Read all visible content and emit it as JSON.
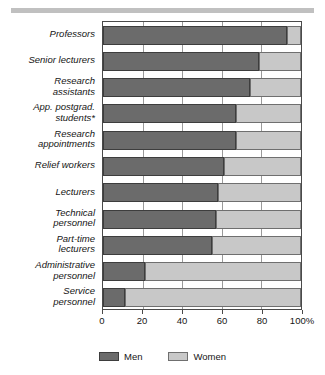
{
  "chart_data": {
    "type": "bar",
    "orientation": "horizontal",
    "stacked": true,
    "normalized": true,
    "title": "",
    "xlabel": "",
    "ylabel": "",
    "xlim": [
      0,
      100
    ],
    "grid": true,
    "legend_position": "bottom",
    "categories": [
      "Professors",
      "Senior lecturers",
      "Research\nassistants",
      "App. postgrad.\nstudents*",
      "Research\nappointments",
      "Relief workers",
      "Lecturers",
      "Technical\npersonnel",
      "Part-time\nlecturers",
      "Administrative\npersonnel",
      "Service\npersonnel"
    ],
    "series": [
      {
        "name": "Men",
        "color": "#6b6b6b",
        "values": [
          93,
          79,
          74,
          67,
          67,
          61,
          58,
          57,
          55,
          21,
          11
        ]
      },
      {
        "name": "Women",
        "color": "#c8c8c8",
        "values": [
          7,
          21,
          26,
          33,
          33,
          39,
          42,
          43,
          45,
          79,
          89
        ]
      }
    ],
    "tick_values": [
      0,
      20,
      40,
      60,
      80,
      100
    ],
    "tick_labels": [
      "0",
      "20",
      "40",
      "60",
      "80",
      "100%"
    ],
    "legend": [
      {
        "label": "Men",
        "color": "#6b6b6b"
      },
      {
        "label": "Women",
        "color": "#c8c8c8"
      }
    ]
  }
}
